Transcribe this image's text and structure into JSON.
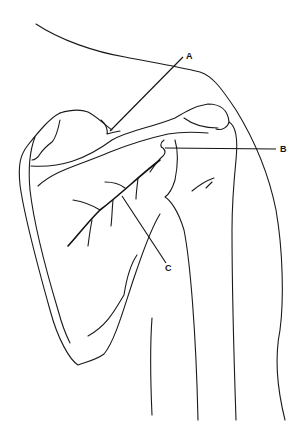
{
  "figure": {
    "type": "anatomical line drawing",
    "line_color": "#1a1a1a",
    "background": "#ffffff"
  },
  "labels": [
    {
      "id": "A",
      "text": "A"
    },
    {
      "id": "B",
      "text": "B"
    },
    {
      "id": "C",
      "text": "C"
    }
  ]
}
